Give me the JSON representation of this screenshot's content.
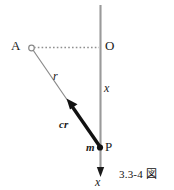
{
  "figure": {
    "caption": "3.3-4 図",
    "colors": {
      "axis_line": "#9a9a9a",
      "thin_line": "#8a8a8a",
      "dotted_line": "#9a9a9a",
      "vector_arrow": "#111111",
      "text": "#1a1a1a",
      "background": "#ffffff"
    },
    "points": [
      {
        "id": "A",
        "label": "A",
        "marker": "open-circle",
        "x": 31,
        "y": 48
      },
      {
        "id": "O",
        "label": "O",
        "marker": "none",
        "x": 100,
        "y": 48
      },
      {
        "id": "P",
        "label": "P",
        "marker": "filled-dot",
        "x": 100,
        "y": 148
      }
    ],
    "labels": {
      "point_a": "A",
      "point_o": "O",
      "point_p": "P",
      "radius": "r",
      "vector": "cr",
      "mass": "m",
      "axis_upper": "x",
      "axis_lower": "x"
    },
    "elements": {
      "vertical_axis": "vertical-axis-line",
      "dotted_connector": "dotted-connector-A-to-O",
      "thin_radius_line": "thin-line-A-to-P",
      "thick_vector": "thick-vector-P-to-A",
      "axis_arrow": "downward-axis-arrow"
    }
  }
}
